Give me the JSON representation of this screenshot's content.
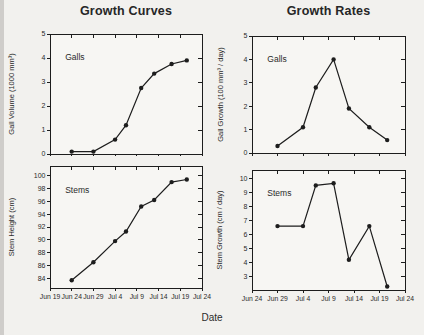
{
  "titles": {
    "left": "Growth Curves",
    "right": "Growth Rates",
    "xlabel": "Date"
  },
  "ink_color": "#1d1d1d",
  "chart_data": [
    {
      "id": "gall-volume",
      "type": "line",
      "column_title": "Growth Curves",
      "panel_label": "Galls",
      "ylabel": "Gall Volume (1000 mm³)",
      "xlabel": "Date",
      "xlim": [
        0,
        35
      ],
      "ylim": [
        0,
        5
      ],
      "x_origin_date": "Jun 19",
      "xtick_values": [
        0,
        5,
        10,
        15,
        20,
        25,
        30,
        35
      ],
      "xtick_labels": [],
      "yticks": [
        0,
        1,
        2,
        3,
        4,
        5
      ],
      "x": [
        5,
        10,
        15,
        17.5,
        21,
        24,
        28,
        31.5
      ],
      "point_dates": [
        "Jun 24",
        "Jun 29",
        "Jul 4",
        "Jul 6",
        "Jul 10",
        "Jul 13",
        "Jul 17",
        "Jul 20"
      ],
      "y": [
        0.1,
        0.1,
        0.6,
        1.2,
        2.75,
        3.35,
        3.75,
        3.9
      ],
      "marker": "filled-circle",
      "line_color": "#1d1d1d",
      "grid": false,
      "legend": null
    },
    {
      "id": "gall-growth",
      "type": "line",
      "column_title": "Growth Rates",
      "panel_label": "Galls",
      "ylabel": "Gall Growth (100 mm³ / day)",
      "xlabel": "Date",
      "xlim": [
        0,
        30
      ],
      "ylim": [
        0,
        5
      ],
      "x_origin_date": "Jun 24",
      "xtick_values": [
        0,
        5,
        10,
        15,
        20,
        25,
        30
      ],
      "xtick_labels": [],
      "yticks": [
        0,
        1,
        2,
        3,
        4,
        5
      ],
      "x": [
        5,
        10,
        12.5,
        16,
        19,
        23,
        26.5
      ],
      "point_dates": [
        "Jun 29",
        "Jul 4",
        "Jul 6",
        "Jul 10",
        "Jul 13",
        "Jul 17",
        "Jul 20"
      ],
      "y": [
        0.3,
        1.1,
        2.8,
        4.0,
        1.9,
        1.1,
        0.55
      ],
      "marker": "filled-circle",
      "line_color": "#1d1d1d",
      "grid": false,
      "legend": null
    },
    {
      "id": "stem-height",
      "type": "line",
      "column_title": "Growth Curves",
      "panel_label": "Stems",
      "ylabel": "Stem Height (cm)",
      "xlabel": "Date",
      "xlim": [
        0,
        35
      ],
      "ylim": [
        82.5,
        101.5
      ],
      "x_origin_date": "Jun 19",
      "xtick_values": [
        0,
        5,
        10,
        15,
        20,
        25,
        30,
        35
      ],
      "xtick_labels": [
        "Jun 19",
        "Jun 24",
        "Jun 29",
        "Jul 4",
        "Jul 9",
        "Jul 14",
        "Jul 19",
        "Jul 24"
      ],
      "yticks": [
        84,
        86,
        88,
        90,
        92,
        94,
        96,
        98,
        100
      ],
      "x": [
        5,
        10,
        15,
        17.5,
        21,
        24,
        28,
        31.5
      ],
      "point_dates": [
        "Jun 24",
        "Jun 29",
        "Jul 4",
        "Jul 6",
        "Jul 10",
        "Jul 13",
        "Jul 17",
        "Jul 20"
      ],
      "y": [
        83.7,
        86.5,
        89.8,
        91.3,
        95.2,
        96.2,
        99.0,
        99.4
      ],
      "marker": "filled-circle",
      "line_color": "#1d1d1d",
      "grid": false,
      "legend": null
    },
    {
      "id": "stem-growth",
      "type": "line",
      "column_title": "Growth Rates",
      "panel_label": "Stems",
      "ylabel": "Stem Growth (cm / day)",
      "xlabel": "Date",
      "xlim": [
        0,
        30
      ],
      "ylim": [
        2.05,
        10.6
      ],
      "x_origin_date": "Jun 24",
      "xtick_values": [
        0,
        5,
        10,
        15,
        20,
        25,
        30
      ],
      "xtick_labels": [
        "Jun 24",
        "Jun 29",
        "Jul 4",
        "Jul 9",
        "Jul 14",
        "Jul 19",
        "Jul 24"
      ],
      "yticks": [
        3,
        4,
        5,
        6,
        7,
        8,
        9,
        10
      ],
      "x": [
        5,
        10,
        12.5,
        16,
        19,
        23,
        26.5
      ],
      "point_dates": [
        "Jun 29",
        "Jul 4",
        "Jul 6",
        "Jul 10",
        "Jul 13",
        "Jul 17",
        "Jul 20"
      ],
      "y": [
        6.6,
        6.6,
        9.5,
        9.65,
        4.2,
        6.6,
        2.3
      ],
      "marker": "filled-circle",
      "line_color": "#1d1d1d",
      "grid": false,
      "legend": null
    }
  ]
}
